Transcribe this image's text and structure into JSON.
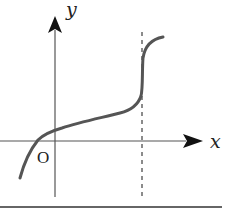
{
  "diagram": {
    "type": "function-graph",
    "labels": {
      "x_axis": "x",
      "y_axis": "y",
      "origin": "O"
    },
    "colors": {
      "axis": "#555555",
      "curve": "#555555",
      "asymptote": "#666666",
      "text": "#222222",
      "baseline": "#333333"
    },
    "elements": {
      "curve": "S-shaped increasing curve, crossing x-axis left of origin, steep near vertical dashed line",
      "dashed_line": "vertical dashed line right of origin",
      "baseline": "horizontal rule beneath graph"
    }
  }
}
